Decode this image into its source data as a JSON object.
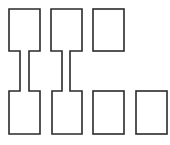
{
  "diagram": {
    "width": 170,
    "height": 145,
    "stroke_color": "#2a2a2a",
    "fill_color": "#ffffff",
    "shapes": [
      {
        "id": "connected-pair-1",
        "type": "dumbbell",
        "top": {
          "x": 9,
          "y": 9,
          "w": 31,
          "h": 42
        },
        "neck": {
          "x": 20,
          "w": 9
        },
        "bottom": {
          "x": 9,
          "y": 91,
          "w": 31,
          "h": 43
        }
      },
      {
        "id": "connected-pair-2",
        "type": "dumbbell",
        "top": {
          "x": 51,
          "y": 9,
          "w": 31,
          "h": 42
        },
        "neck": {
          "x": 62,
          "w": 8
        },
        "bottom": {
          "x": 52,
          "y": 91,
          "w": 30,
          "h": 43
        }
      },
      {
        "id": "rect-top-3",
        "type": "rect",
        "x": 93,
        "y": 9,
        "w": 31,
        "h": 42
      },
      {
        "id": "rect-bottom-3",
        "type": "rect",
        "x": 93,
        "y": 91,
        "w": 31,
        "h": 43
      },
      {
        "id": "rect-bottom-4",
        "type": "rect",
        "x": 136,
        "y": 91,
        "w": 31,
        "h": 43
      }
    ]
  }
}
